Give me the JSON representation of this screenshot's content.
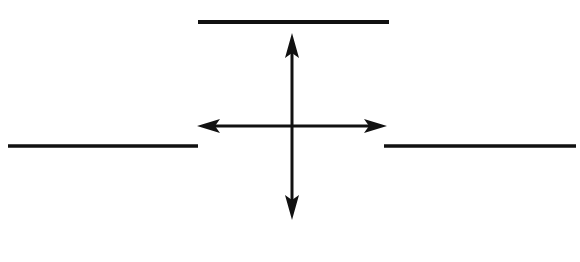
{
  "diagram": {
    "colors": {
      "stroke": "#111111",
      "background": "#ffffff"
    },
    "segments": [
      {
        "id": "top-line",
        "x1": 198,
        "y1": 22,
        "x2": 389,
        "y2": 22
      },
      {
        "id": "left-line",
        "x1": 8,
        "y1": 146,
        "x2": 198,
        "y2": 146
      },
      {
        "id": "right-line",
        "x1": 384,
        "y1": 146,
        "x2": 576,
        "y2": 146
      }
    ],
    "arrows": [
      {
        "id": "vertical-double-arrow",
        "x1": 292,
        "y1": 33,
        "x2": 292,
        "y2": 220
      },
      {
        "id": "horizontal-double-arrow",
        "x1": 197,
        "y1": 126,
        "x2": 387,
        "y2": 126
      }
    ]
  }
}
